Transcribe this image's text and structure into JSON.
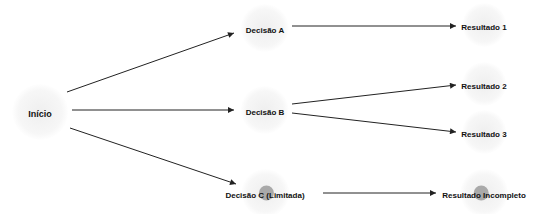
{
  "diagram": {
    "type": "decision-flow",
    "nodes": [
      {
        "id": "inicio",
        "label": "Início",
        "x": 40,
        "y": 112,
        "limited": false
      },
      {
        "id": "decisao_a",
        "label": "Decisão A",
        "x": 265,
        "y": 28,
        "limited": false
      },
      {
        "id": "decisao_b",
        "label": "Decisão B",
        "x": 265,
        "y": 110,
        "limited": false
      },
      {
        "id": "decisao_c",
        "label": "Decisão C (Limitada)",
        "x": 265,
        "y": 193,
        "limited": true
      },
      {
        "id": "resultado_1",
        "label": "Resultado 1",
        "x": 484,
        "y": 25,
        "limited": false
      },
      {
        "id": "resultado_2",
        "label": "Resultado 2",
        "x": 484,
        "y": 84,
        "limited": false
      },
      {
        "id": "resultado_3",
        "label": "Resultado 3",
        "x": 484,
        "y": 132,
        "limited": false
      },
      {
        "id": "resultado_incompleto",
        "label": "Resultado Incompleto",
        "x": 484,
        "y": 193,
        "limited": true
      }
    ],
    "edges": [
      {
        "from": "inicio",
        "to": "decisao_a",
        "x1": 67,
        "y1": 92,
        "x2": 234,
        "y2": 33
      },
      {
        "from": "inicio",
        "to": "decisao_b",
        "x1": 72,
        "y1": 110,
        "x2": 234,
        "y2": 110
      },
      {
        "from": "inicio",
        "to": "decisao_c",
        "x1": 70,
        "y1": 128,
        "x2": 236,
        "y2": 184
      },
      {
        "from": "decisao_a",
        "to": "resultado_1",
        "x1": 292,
        "y1": 26,
        "x2": 456,
        "y2": 26
      },
      {
        "from": "decisao_b",
        "to": "resultado_2",
        "x1": 292,
        "y1": 104,
        "x2": 456,
        "y2": 85
      },
      {
        "from": "decisao_b",
        "to": "resultado_3",
        "x1": 292,
        "y1": 113,
        "x2": 456,
        "y2": 132
      },
      {
        "from": "decisao_c",
        "to": "resultado_incompleto",
        "x1": 323,
        "y1": 193,
        "x2": 436,
        "y2": 193
      }
    ],
    "colors": {
      "edge": "#222222",
      "text": "#111111",
      "halo": "#eeeeee",
      "limited_dot": "#a9a9a9"
    }
  }
}
